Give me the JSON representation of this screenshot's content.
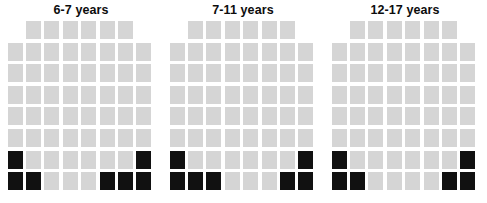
{
  "figure": {
    "type": "waffle-chart-group",
    "panel_count": 3,
    "colors": {
      "filled": "#111111",
      "empty": "#d5d5d5",
      "background": "#ffffff",
      "title": "#0d0d0d"
    }
  },
  "panels": [
    {
      "title": "6-7 years"
    },
    {
      "title": "7-11 years"
    },
    {
      "title": "12-17 years"
    }
  ],
  "chart_data": {
    "type": "waffle",
    "title": "",
    "xlabel": "",
    "ylabel": "",
    "legend": [],
    "grid": false,
    "columns": 8,
    "rows": 8,
    "cell_colors": {
      "filled": "#111111",
      "empty": "#d5d5d5"
    },
    "row_layout": [
      6,
      8,
      8,
      8,
      8,
      8,
      8,
      8
    ],
    "row_offsets": [
      1,
      0,
      0,
      0,
      0,
      0,
      0,
      0
    ],
    "total_cells_per_panel": 62,
    "fill_order": "bottom-up",
    "categories": [
      "6-7 years",
      "7-11 years",
      "12-17 years"
    ],
    "values": [
      7,
      7,
      6
    ],
    "series": [
      {
        "name": "6-7 years",
        "filled_count": 7,
        "total": 62,
        "percent": 11.3,
        "grid": [
          [
            0,
            0,
            0,
            0,
            0,
            0
          ],
          [
            0,
            0,
            0,
            0,
            0,
            0,
            0,
            0
          ],
          [
            0,
            0,
            0,
            0,
            0,
            0,
            0,
            0
          ],
          [
            0,
            0,
            0,
            0,
            0,
            0,
            0,
            0
          ],
          [
            0,
            0,
            0,
            0,
            0,
            0,
            0,
            0
          ],
          [
            0,
            0,
            0,
            0,
            0,
            0,
            0,
            0
          ],
          [
            1,
            0,
            0,
            0,
            0,
            0,
            0,
            1
          ],
          [
            1,
            1,
            0,
            0,
            0,
            1,
            1,
            1
          ]
        ]
      },
      {
        "name": "7-11 years",
        "filled_count": 7,
        "total": 62,
        "percent": 11.3,
        "grid": [
          [
            0,
            0,
            0,
            0,
            0,
            0
          ],
          [
            0,
            0,
            0,
            0,
            0,
            0,
            0,
            0
          ],
          [
            0,
            0,
            0,
            0,
            0,
            0,
            0,
            0
          ],
          [
            0,
            0,
            0,
            0,
            0,
            0,
            0,
            0
          ],
          [
            0,
            0,
            0,
            0,
            0,
            0,
            0,
            0
          ],
          [
            0,
            0,
            0,
            0,
            0,
            0,
            0,
            0
          ],
          [
            1,
            0,
            0,
            0,
            0,
            0,
            0,
            1
          ],
          [
            1,
            1,
            1,
            0,
            0,
            0,
            1,
            1
          ]
        ]
      },
      {
        "name": "12-17 years",
        "filled_count": 6,
        "total": 62,
        "percent": 9.7,
        "grid": [
          [
            0,
            0,
            0,
            0,
            0,
            0
          ],
          [
            0,
            0,
            0,
            0,
            0,
            0,
            0,
            0
          ],
          [
            0,
            0,
            0,
            0,
            0,
            0,
            0,
            0
          ],
          [
            0,
            0,
            0,
            0,
            0,
            0,
            0,
            0
          ],
          [
            0,
            0,
            0,
            0,
            0,
            0,
            0,
            0
          ],
          [
            0,
            0,
            0,
            0,
            0,
            0,
            0,
            0
          ],
          [
            1,
            0,
            0,
            0,
            0,
            0,
            0,
            1
          ],
          [
            1,
            1,
            0,
            0,
            0,
            0,
            1,
            1
          ]
        ]
      }
    ]
  }
}
